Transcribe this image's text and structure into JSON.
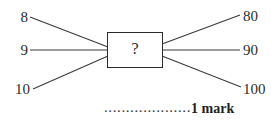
{
  "diagram": {
    "type": "mapping-diagram",
    "center_box": {
      "label": "?"
    },
    "inputs": [
      {
        "label": "8"
      },
      {
        "label": "9"
      },
      {
        "label": "10"
      }
    ],
    "outputs": [
      {
        "label": "80"
      },
      {
        "label": "90"
      },
      {
        "label": "100"
      }
    ],
    "mappings": [
      {
        "from": "8",
        "to": "80"
      },
      {
        "from": "9",
        "to": "90"
      },
      {
        "from": "10",
        "to": "100"
      }
    ],
    "colors": {
      "line": "#3a3a3a",
      "box_border": "#2b2b2b",
      "text": "#2c2c2c",
      "background": "#ffffff"
    }
  },
  "footer": {
    "leader_dots": "....................",
    "marks_label": "1 mark"
  }
}
